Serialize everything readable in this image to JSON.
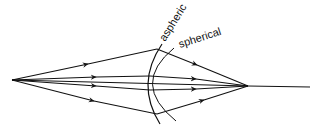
{
  "diagram": {
    "labels": {
      "aspheric": "aspheric",
      "spherical": "spherical"
    },
    "colors": {
      "line": "#111111",
      "background": "#ffffff"
    },
    "points": {
      "source": [
        12,
        80
      ],
      "focus": [
        248,
        86
      ],
      "axis_end": [
        310,
        87
      ]
    }
  }
}
